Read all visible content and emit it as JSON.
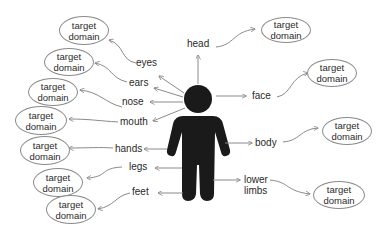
{
  "diagram": {
    "center_figure": "person-silhouette",
    "target_label_line1": "target",
    "target_label_line2": "domain",
    "parts": [
      {
        "id": "eyes",
        "label": "eyes"
      },
      {
        "id": "ears",
        "label": "ears"
      },
      {
        "id": "nose",
        "label": "nose"
      },
      {
        "id": "mouth",
        "label": "mouth"
      },
      {
        "id": "hands",
        "label": "hands"
      },
      {
        "id": "legs",
        "label": "legs"
      },
      {
        "id": "feet",
        "label": "feet"
      },
      {
        "id": "head",
        "label": "head"
      },
      {
        "id": "face",
        "label": "face"
      },
      {
        "id": "body",
        "label": "body"
      },
      {
        "id": "lower_limbs",
        "label": "lower limbs",
        "line1": "lower",
        "line2": "limbs"
      }
    ],
    "targets": [
      {
        "for": "eyes",
        "line1": "target",
        "line2": "domain"
      },
      {
        "for": "ears",
        "line1": "target",
        "line2": "domain"
      },
      {
        "for": "nose",
        "line1": "target",
        "line2": "domain"
      },
      {
        "for": "mouth",
        "line1": "target",
        "line2": "domain"
      },
      {
        "for": "hands",
        "line1": "target",
        "line2": "domain"
      },
      {
        "for": "legs",
        "line1": "target",
        "line2": "domain"
      },
      {
        "for": "feet",
        "line1": "target",
        "line2": "domain"
      },
      {
        "for": "head",
        "line1": "target",
        "line2": "domain"
      },
      {
        "for": "face",
        "line1": "target",
        "line2": "domain"
      },
      {
        "for": "body",
        "line1": "target",
        "line2": "domain"
      },
      {
        "for": "lower_limbs",
        "line1": "target",
        "line2": "domain"
      }
    ],
    "colors": {
      "figure": "#1a1a1a",
      "arrow": "#8a8a8a",
      "text": "#2a2a2a",
      "ellipse_border": "#8a8a8a"
    }
  }
}
